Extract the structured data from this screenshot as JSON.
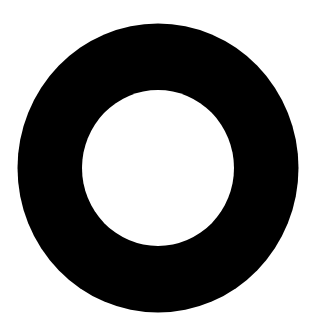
{
  "figure": {
    "shape": "ring",
    "background_color": "#ffffff",
    "ring_color": "#000000",
    "hole_color": "#ffffff",
    "outer": {
      "cx": 158,
      "cy": 168,
      "rx": 140.5,
      "ry": 144.5
    },
    "inner": {
      "cx": 158,
      "cy": 168,
      "rx": 76,
      "ry": 78
    }
  }
}
